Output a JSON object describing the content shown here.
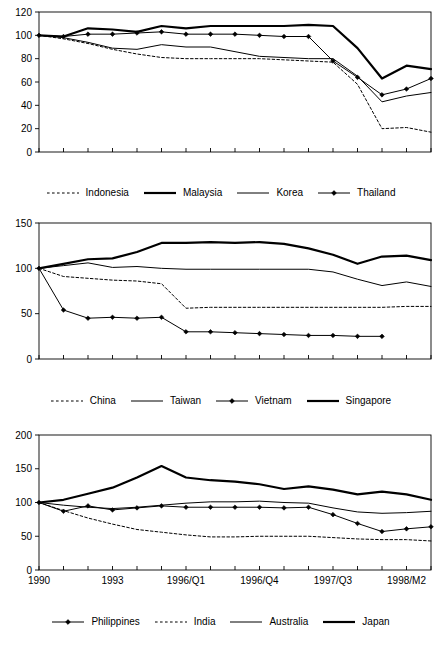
{
  "figure": {
    "type": "multi-panel-line-chart",
    "panel_count": 3,
    "background_color": "#ffffff",
    "line_color": "#000000",
    "shared_xaxis": true,
    "x_tick_labels_only_on_last_panel": true
  },
  "x_axis": {
    "label": "",
    "n_points": 17,
    "tick_label_indices": [
      0,
      3,
      6,
      9,
      12,
      15
    ],
    "tick_labels": [
      "1990",
      "1993",
      "1996/Q1",
      "1996/Q4",
      "1997/Q3",
      "1998/M2"
    ],
    "all_point_labels": [
      "1990",
      "",
      "",
      "1993",
      "",
      "",
      "1996/Q1",
      "",
      "",
      "1996/Q4",
      "",
      "",
      "1997/Q3",
      "",
      "",
      "1998/M2",
      ""
    ]
  },
  "chart_data": [
    {
      "id": "panel-1",
      "type": "line",
      "title": "",
      "xlabel": "",
      "ylabel": "",
      "ylim": [
        0,
        120
      ],
      "yticks": [
        0,
        20,
        40,
        60,
        80,
        100,
        120
      ],
      "grid": false,
      "legend_position": "below",
      "categories": [
        "1990",
        "",
        "",
        "1993",
        "",
        "",
        "1996/Q1",
        "",
        "",
        "1996/Q4",
        "",
        "",
        "1997/Q3",
        "",
        "",
        "1998/M2",
        ""
      ],
      "series": [
        {
          "name": "Indonesia",
          "style": "dashed",
          "marker": "none",
          "width": 1,
          "values": [
            100,
            97,
            93,
            88,
            84,
            81,
            80,
            80,
            80,
            80,
            79,
            78,
            77,
            58,
            20,
            21,
            17
          ]
        },
        {
          "name": "Malaysia",
          "style": "solid",
          "marker": "none",
          "width": 2.2,
          "values": [
            100,
            99,
            106,
            105,
            103,
            108,
            106,
            108,
            108,
            108,
            108,
            109,
            108,
            89,
            63,
            74,
            71
          ]
        },
        {
          "name": "Korea",
          "style": "solid",
          "marker": "none",
          "width": 1,
          "values": [
            100,
            98,
            94,
            89,
            88,
            92,
            90,
            90,
            86,
            82,
            81,
            80,
            80,
            65,
            43,
            48,
            51
          ]
        },
        {
          "name": "Thailand",
          "style": "solid",
          "marker": "diamond",
          "width": 1,
          "values": [
            100,
            99,
            101,
            101,
            102,
            103,
            101,
            101,
            101,
            100,
            99,
            99,
            78,
            64,
            49,
            54,
            63
          ]
        }
      ]
    },
    {
      "id": "panel-2",
      "type": "line",
      "title": "",
      "xlabel": "",
      "ylabel": "",
      "ylim": [
        0,
        150
      ],
      "yticks": [
        0,
        50,
        100,
        150
      ],
      "grid": false,
      "legend_position": "below",
      "categories": [
        "1990",
        "",
        "",
        "1993",
        "",
        "",
        "1996/Q1",
        "",
        "",
        "1996/Q4",
        "",
        "",
        "1997/Q3",
        "",
        "",
        "1998/M2",
        ""
      ],
      "series": [
        {
          "name": "China",
          "style": "dashed",
          "marker": "none",
          "width": 1,
          "values": [
            100,
            91,
            89,
            87,
            86,
            83,
            56,
            57,
            57,
            57,
            57,
            57,
            57,
            57,
            57,
            58,
            58
          ]
        },
        {
          "name": "Taiwan",
          "style": "solid",
          "marker": "none",
          "width": 1,
          "values": [
            100,
            103,
            106,
            101,
            102,
            100,
            99,
            99,
            99,
            99,
            99,
            99,
            96,
            88,
            81,
            85,
            80
          ]
        },
        {
          "name": "Vietnam",
          "style": "solid",
          "marker": "diamond",
          "width": 1,
          "values": [
            100,
            54,
            45,
            46,
            45,
            46,
            30,
            30,
            29,
            28,
            27,
            26,
            26,
            25,
            25,
            null,
            null
          ]
        },
        {
          "name": "Singapore",
          "style": "solid",
          "marker": "none",
          "width": 2.2,
          "values": [
            100,
            105,
            110,
            111,
            118,
            128,
            128,
            129,
            128,
            129,
            127,
            122,
            115,
            105,
            113,
            114,
            109
          ]
        }
      ]
    },
    {
      "id": "panel-3",
      "type": "line",
      "title": "",
      "xlabel": "",
      "ylabel": "",
      "ylim": [
        0,
        200
      ],
      "yticks": [
        0,
        50,
        100,
        150,
        200
      ],
      "grid": false,
      "legend_position": "below",
      "categories": [
        "1990",
        "",
        "",
        "1993",
        "",
        "",
        "1996/Q1",
        "",
        "",
        "1996/Q4",
        "",
        "",
        "1997/Q3",
        "",
        "",
        "1998/M2",
        ""
      ],
      "series": [
        {
          "name": "Philippines",
          "style": "solid",
          "marker": "diamond",
          "width": 1,
          "values": [
            100,
            87,
            95,
            89,
            92,
            95,
            93,
            93,
            93,
            93,
            92,
            93,
            82,
            69,
            57,
            61,
            64
          ]
        },
        {
          "name": "India",
          "style": "dashed",
          "marker": "none",
          "width": 1,
          "values": [
            100,
            88,
            77,
            68,
            60,
            56,
            52,
            49,
            49,
            50,
            50,
            50,
            48,
            46,
            45,
            45,
            43
          ]
        },
        {
          "name": "Australia",
          "style": "solid",
          "marker": "none",
          "width": 1,
          "values": [
            100,
            96,
            93,
            91,
            93,
            96,
            99,
            101,
            101,
            102,
            100,
            99,
            92,
            86,
            84,
            85,
            87
          ]
        },
        {
          "name": "Japan",
          "style": "solid",
          "marker": "none",
          "width": 2.2,
          "values": [
            100,
            104,
            113,
            122,
            137,
            154,
            137,
            133,
            131,
            127,
            120,
            124,
            119,
            112,
            116,
            112,
            104
          ]
        }
      ]
    }
  ]
}
